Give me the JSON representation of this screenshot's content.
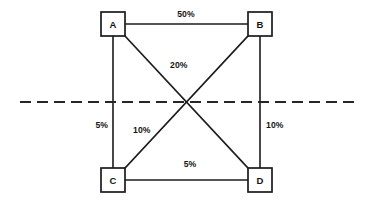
{
  "diagram": {
    "background_color": "#ffffff",
    "line_color": "#1b1b1b",
    "axis_color": "#262626",
    "nodes": [
      {
        "id": "A",
        "label": "A",
        "x": 113,
        "y": 24
      },
      {
        "id": "B",
        "label": "B",
        "x": 260,
        "y": 24
      },
      {
        "id": "C",
        "label": "C",
        "x": 113,
        "y": 180
      },
      {
        "id": "D",
        "label": "D",
        "x": 260,
        "y": 180
      }
    ],
    "edges": [
      {
        "from": "A",
        "to": "B",
        "label": "50%",
        "label_x": 186,
        "label_y": 17,
        "anchor": "mid"
      },
      {
        "from": "A",
        "to": "D",
        "label": "20%",
        "label_x": 170,
        "label_y": 68,
        "anchor": "start"
      },
      {
        "from": "A",
        "to": "C",
        "label": "5%",
        "label_x": 108,
        "label_y": 128,
        "anchor": "end"
      },
      {
        "from": "C",
        "to": "B",
        "label": "10%",
        "label_x": 133,
        "label_y": 133,
        "anchor": "start"
      },
      {
        "from": "B",
        "to": "D",
        "label": "10%",
        "label_x": 266,
        "label_y": 128,
        "anchor": "start"
      },
      {
        "from": "C",
        "to": "D",
        "label": "5%",
        "label_x": 190,
        "label_y": 167,
        "anchor": "mid"
      }
    ],
    "divider": {
      "name": "horizontal-dashed-axis",
      "x1": 20,
      "x2": 355,
      "y": 102
    },
    "geometry": {
      "box_size": 24,
      "box_half": 12
    }
  }
}
